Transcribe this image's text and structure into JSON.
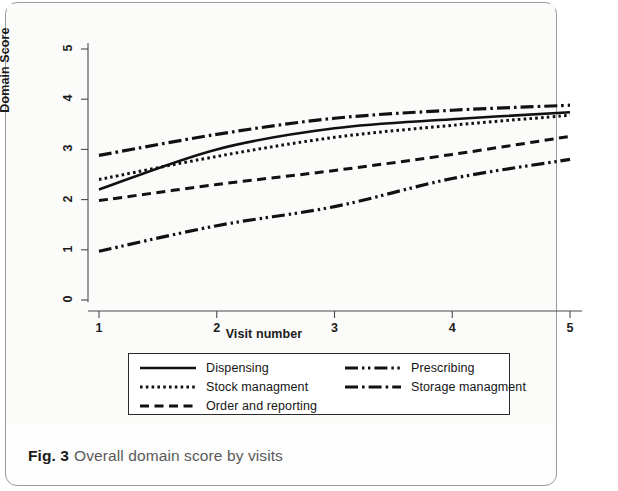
{
  "figure": {
    "caption_label": "Fig. 3",
    "caption_text": "Overall domain score by visits"
  },
  "chart_data": {
    "type": "line",
    "title": "",
    "xlabel": "Visit number",
    "ylabel": "Domain Score",
    "x": [
      1,
      2,
      3,
      4,
      5
    ],
    "xticks": [
      "1",
      "2",
      "3",
      "4",
      "5"
    ],
    "yticks": [
      "0",
      "1",
      "2",
      "3",
      "4",
      "5"
    ],
    "xlim": [
      1,
      5
    ],
    "ylim": [
      0,
      5
    ],
    "grid": false,
    "legend_position": "below-axes",
    "series": [
      {
        "name": "Dispensing",
        "style": "solid",
        "color": "#111111",
        "values": [
          2.2,
          3.0,
          3.42,
          3.6,
          3.74
        ]
      },
      {
        "name": "Stock managment",
        "style": "dotted",
        "color": "#111111",
        "values": [
          2.4,
          2.86,
          3.24,
          3.48,
          3.68
        ]
      },
      {
        "name": "Order and reporting",
        "style": "dashed",
        "color": "#111111",
        "values": [
          1.98,
          2.3,
          2.58,
          2.9,
          3.26
        ]
      },
      {
        "name": "Prescribing",
        "style": "dash-dot-dot",
        "color": "#111111",
        "values": [
          0.97,
          1.48,
          1.86,
          2.42,
          2.8
        ]
      },
      {
        "name": "Storage managment",
        "style": "dash-dot",
        "color": "#111111",
        "values": [
          2.88,
          3.3,
          3.62,
          3.78,
          3.88
        ]
      }
    ]
  },
  "legend": {
    "rows": [
      {
        "name": "Dispensing",
        "style": "solid"
      },
      {
        "name": "Prescribing",
        "style": "dash-dot-dot"
      },
      {
        "name": "Stock managment",
        "style": "dotted"
      },
      {
        "name": "Storage managment",
        "style": "dash-dot"
      },
      {
        "name": "Order and reporting",
        "style": "dashed"
      }
    ]
  }
}
